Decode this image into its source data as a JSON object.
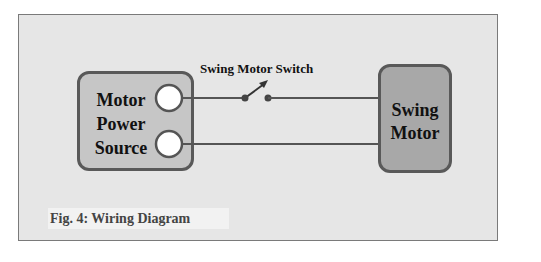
{
  "figure": {
    "caption": "Fig. 4: Wiring Diagram",
    "background_color": "#e6e6e6"
  },
  "components": {
    "power_source": {
      "label_lines": [
        "Motor",
        "Power",
        "Source"
      ],
      "fill_color": "#c6c6c6",
      "terminals": 2
    },
    "swing_motor": {
      "label_lines": [
        "Swing",
        "Motor"
      ],
      "fill_color": "#a8a8a8"
    },
    "switch": {
      "label": "Swing Motor Switch",
      "state": "open"
    }
  },
  "connections": [
    {
      "from": "power_source.terminal_1",
      "to": "switch",
      "via": "swing_motor"
    },
    {
      "from": "power_source.terminal_2",
      "to": "swing_motor"
    }
  ]
}
